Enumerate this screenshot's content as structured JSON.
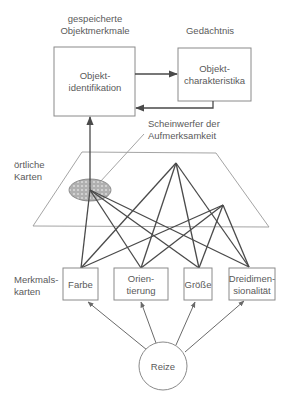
{
  "labels": {
    "stored_features_line1": "gespeicherte",
    "stored_features_line2": "Objektmerkmale",
    "memory": "Gedächtnis",
    "spotlight_line1": "Scheinwerfer der",
    "spotlight_line2": "Aufmerksamkeit",
    "location_maps_line1": "örtliche",
    "location_maps_line2": "Karten",
    "feature_maps_line1": "Merkmals-",
    "feature_maps_line2": "karten"
  },
  "boxes": {
    "object_identification": {
      "line1": "Objekt-",
      "line2": "identifikation"
    },
    "object_characteristics": {
      "line1": "Objekt-",
      "line2": "charakteristika"
    }
  },
  "feature_maps": [
    {
      "line1": "Farbe",
      "line2": ""
    },
    {
      "line1": "Orien-",
      "line2": "tierung"
    },
    {
      "line1": "Größe",
      "line2": ""
    },
    {
      "line1": "Dreidimen-",
      "line2": "sionalität"
    }
  ],
  "stimulus": {
    "label": "Reize"
  },
  "colors": {
    "stroke_dark": "#4a4a4a",
    "stroke_light": "#9a9a9a",
    "text": "#5a5a5a",
    "spotlight_fill": "#b5b5b5"
  }
}
